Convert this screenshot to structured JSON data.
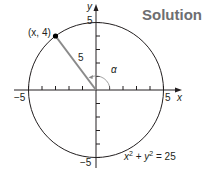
{
  "title": "Solution",
  "diagram": {
    "type": "unit-circle-style",
    "circle_equation": "x² + y² = 25",
    "radius": 5,
    "point_label": "(x, 4)",
    "segment_label": "5",
    "angle_label": "α",
    "axis_labels": {
      "x": "x",
      "y": "y"
    },
    "tick_labels": {
      "x_neg": "−5",
      "x_pos": "5",
      "y_pos": "5",
      "y_neg": "−5"
    },
    "colors": {
      "title": "#6d6e71",
      "segment": "#8a8a8a",
      "lines": "#231f20"
    }
  }
}
